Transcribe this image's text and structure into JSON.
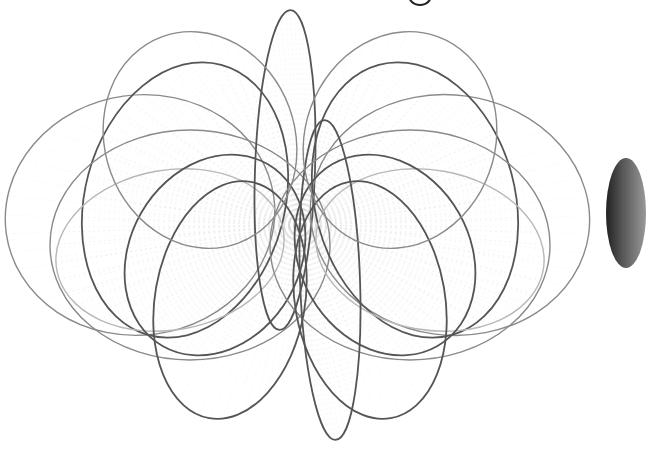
{
  "image": {
    "description": "Monochrome line drawing of overlapping elliptical loops radiating from a central point, resembling magnetic field lines",
    "background": "#ffffff",
    "stroke_dark": "#555555",
    "stroke_mid": "#8a8a8a",
    "stroke_light": "#b8b8b8",
    "hatch": "#d0d0d0",
    "center": [
      300,
      225
    ]
  },
  "loops": [
    {
      "cx": 140,
      "cy": 215,
      "rx": 135,
      "ry": 120,
      "rot": -8,
      "tone": "mid"
    },
    {
      "cx": 185,
      "cy": 200,
      "rx": 100,
      "ry": 140,
      "rot": 15,
      "tone": "dark"
    },
    {
      "cx": 170,
      "cy": 250,
      "rx": 115,
      "ry": 80,
      "rot": -10,
      "tone": "light"
    },
    {
      "cx": 190,
      "cy": 245,
      "rx": 140,
      "ry": 115,
      "rot": 0,
      "tone": "mid"
    },
    {
      "cx": 215,
      "cy": 255,
      "rx": 85,
      "ry": 105,
      "rot": 30,
      "tone": "dark"
    },
    {
      "cx": 230,
      "cy": 300,
      "rx": 75,
      "ry": 120,
      "rot": 10,
      "tone": "dark"
    },
    {
      "cx": 285,
      "cy": 170,
      "rx": 30,
      "ry": 160,
      "rot": 2,
      "tone": "dark"
    },
    {
      "cx": 450,
      "cy": 215,
      "rx": 140,
      "ry": 120,
      "rot": 8,
      "tone": "mid"
    },
    {
      "cx": 415,
      "cy": 200,
      "rx": 100,
      "ry": 140,
      "rot": -15,
      "tone": "dark"
    },
    {
      "cx": 430,
      "cy": 250,
      "rx": 115,
      "ry": 80,
      "rot": 10,
      "tone": "light"
    },
    {
      "cx": 410,
      "cy": 245,
      "rx": 140,
      "ry": 115,
      "rot": 0,
      "tone": "mid"
    },
    {
      "cx": 385,
      "cy": 255,
      "rx": 85,
      "ry": 105,
      "rot": -30,
      "tone": "dark"
    },
    {
      "cx": 370,
      "cy": 300,
      "rx": 75,
      "ry": 120,
      "rot": -10,
      "tone": "dark"
    },
    {
      "cx": 330,
      "cy": 280,
      "rx": 30,
      "ry": 160,
      "rot": -2,
      "tone": "dark"
    },
    {
      "cx": 400,
      "cy": 140,
      "rx": 95,
      "ry": 110,
      "rot": 20,
      "tone": "mid"
    },
    {
      "cx": 200,
      "cy": 140,
      "rx": 95,
      "ry": 110,
      "rot": -20,
      "tone": "mid"
    }
  ],
  "partial_elements": {
    "top_glyph": "g (descender only)",
    "right_edge": "dark shaded ellipse, cut off"
  }
}
